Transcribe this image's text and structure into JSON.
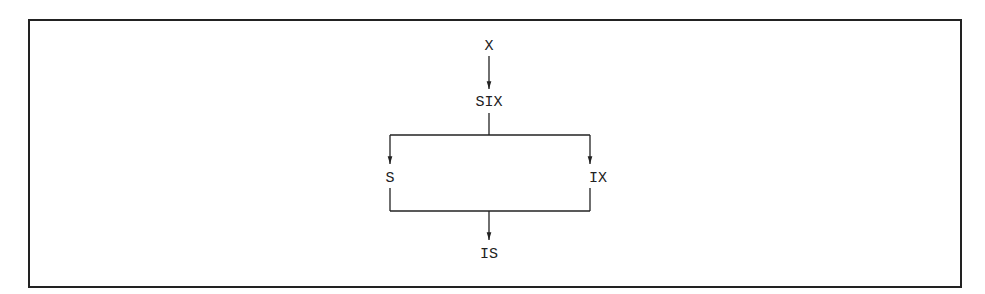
{
  "diagram": {
    "nodes": [
      {
        "id": "x",
        "label": "X"
      },
      {
        "id": "six",
        "label": "SIX"
      },
      {
        "id": "s",
        "label": "S"
      },
      {
        "id": "ix",
        "label": "IX"
      },
      {
        "id": "is",
        "label": "IS"
      }
    ],
    "edges": [
      {
        "from": "X",
        "to": "SIX"
      },
      {
        "from": "SIX",
        "to": "S"
      },
      {
        "from": "SIX",
        "to": "IX"
      },
      {
        "from": "S",
        "to": "IS"
      },
      {
        "from": "IX",
        "to": "IS"
      }
    ],
    "colors": {
      "line": "#222222",
      "background": "#ffffff"
    }
  }
}
